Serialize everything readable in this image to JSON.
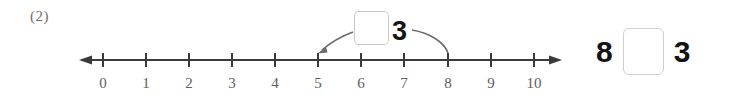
{
  "problem": {
    "number_label": "(2)"
  },
  "numberline": {
    "min": 0,
    "max": 10,
    "tick_labels": [
      "0",
      "1",
      "2",
      "3",
      "4",
      "5",
      "6",
      "7",
      "8",
      "9",
      "10"
    ],
    "left_arrowhead": true,
    "right_arrowhead": true,
    "line_color": "#3a3a3a",
    "label_color": "#5d5d5d",
    "annotations": [
      {
        "name": "arrow-to-5",
        "points_to_value": 5,
        "has_arrowhead": true,
        "style": "curved"
      },
      {
        "name": "arrow-to-8",
        "points_to_value": 8,
        "has_arrowhead": false,
        "style": "curved"
      }
    ]
  },
  "callout": {
    "box_value": "",
    "box_placeholder": "",
    "digit": "3"
  },
  "equation": {
    "left_term": "8",
    "box_value": "",
    "box_placeholder": "",
    "right_term": "3"
  },
  "colors": {
    "ink": "#161616",
    "line": "#3a3a3a",
    "box_border": "#c9c9c9",
    "label": "#5d5d5d",
    "page_background": "#ffffff"
  }
}
